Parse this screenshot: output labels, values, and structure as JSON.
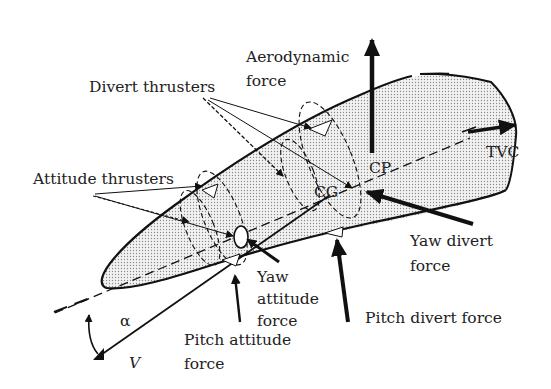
{
  "diagram": {
    "colors": {
      "stroke": "#111111",
      "text": "#222222",
      "body_fill": "#d8d8d8",
      "background": "#ffffff"
    },
    "labels": {
      "aerodynamic_force_line1": "Aerodynamic",
      "aerodynamic_force_line2": "force",
      "divert_thrusters": "Divert thrusters",
      "attitude_thrusters": "Attitude thrusters",
      "tvc": "TVC",
      "cp": "CP",
      "cg": "CG",
      "yaw_divert_force_line1": "Yaw divert",
      "yaw_divert_force_line2": "force",
      "yaw_attitude_force_line1": "Yaw",
      "yaw_attitude_force_line2": "attitude",
      "yaw_attitude_force_line3": "force",
      "pitch_attitude_force_line1": "Pitch attitude",
      "pitch_attitude_force_line2": "force",
      "pitch_divert_force": "Pitch divert force",
      "alpha": "α",
      "velocity": "V"
    }
  }
}
